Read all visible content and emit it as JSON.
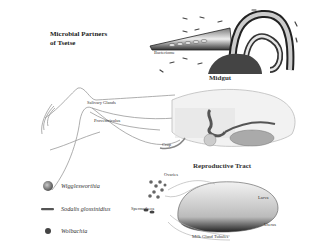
{
  "title": {
    "line1": "Microbial Partners",
    "line2": "of Tsetse"
  },
  "panels": {
    "midgut": {
      "heading": "Midgut",
      "labels": {
        "bacteriome": "Bacteriome"
      }
    },
    "body": {
      "labels": {
        "salivary_glands": "Salivary Glands",
        "proventriculus": "Proventriculus",
        "crop": "Crop"
      }
    },
    "reproductive": {
      "heading": "Reproductive Tract",
      "labels": {
        "ovaries": "Ovaries",
        "spermatheca": "Spermatheca",
        "larva": "Larva",
        "uterus": "Uterus",
        "milk_gland": "Milk Gland Tubules"
      }
    }
  },
  "legend": {
    "items": [
      {
        "symbol": "sphere",
        "label": "Wigglesworthia"
      },
      {
        "symbol": "rod",
        "label": "Sodalis glossinidius"
      },
      {
        "symbol": "dot",
        "label": "Wolbachia"
      }
    ]
  }
}
